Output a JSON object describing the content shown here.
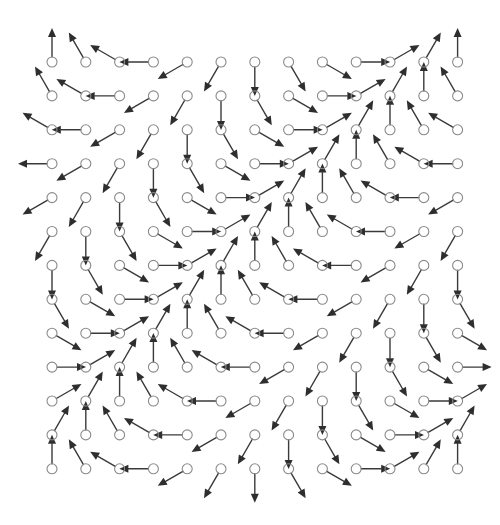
{
  "diagram": {
    "type": "vector-field",
    "grid": {
      "rows": 13,
      "cols": 13,
      "x0": 52,
      "y0": 62,
      "dx": 33.8,
      "dy": 33.9,
      "node_radius": 5,
      "arrow_length": 34
    },
    "angle_rule": {
      "base_deg": 90,
      "step_deg_per_col": 30,
      "step_deg_per_row": 30,
      "convention": "counter-clockwise from +x, screen y up"
    },
    "colors": {
      "node_stroke": "#8a8a8a",
      "arrow": "#3a3a3a",
      "background": "#ffffff"
    }
  }
}
